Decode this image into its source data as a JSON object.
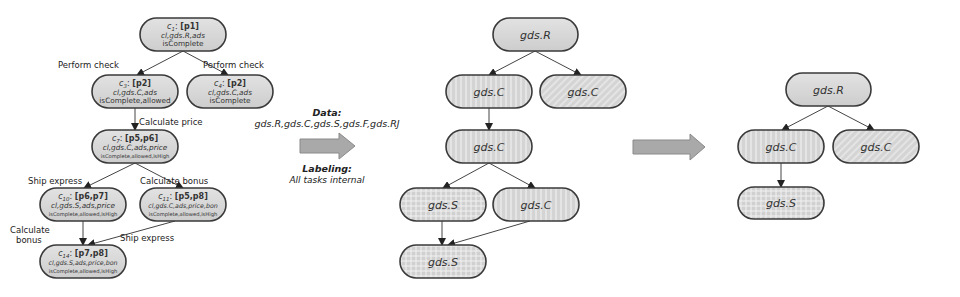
{
  "left_graph": {
    "nodes": [
      {
        "id": "c1",
        "label": "c",
        "sub": "1",
        "places": "[p1]",
        "line2": "cl,gds.R,ads",
        "line3": "isComplete",
        "x": 140,
        "y": 18,
        "w": 86,
        "h": 33
      },
      {
        "id": "c3",
        "label": "c",
        "sub": "3",
        "places": "[p2]",
        "line2": "cl,gds.C,ads",
        "line3": "isComplete,allowed",
        "x": 92,
        "y": 75,
        "w": 86,
        "h": 33
      },
      {
        "id": "c4",
        "label": "c",
        "sub": "4",
        "places": "[p2]",
        "line2": "cl,gds.C,ads",
        "line3": "isComplete",
        "x": 187,
        "y": 75,
        "w": 86,
        "h": 33
      },
      {
        "id": "c7",
        "label": "c",
        "sub": "7",
        "places": "[p5,p6]",
        "line2": "cl,gds.C,ads,price",
        "line3": "isComplete,allowed,isHigh",
        "x": 92,
        "y": 130,
        "w": 86,
        "h": 33
      },
      {
        "id": "c10",
        "label": "c",
        "sub": "10",
        "places": "[p6,p7]",
        "line2": "cl,gds.S,ads,price",
        "line3": "isComplete,allowed,isHigh",
        "x": 40,
        "y": 188,
        "w": 86,
        "h": 33
      },
      {
        "id": "c11",
        "label": "c",
        "sub": "11",
        "places": "[p5,p8]",
        "line2": "cl,gds.C,ads,price,bon",
        "line3": "isComplete,allowed,isHigh",
        "x": 140,
        "y": 188,
        "w": 86,
        "h": 33
      },
      {
        "id": "c14",
        "label": "c",
        "sub": "14",
        "places": "[p7,p8]",
        "line2": "cl,gds.S,ads,price,bon",
        "line3": "isComplete,allowed,isHigh",
        "x": 40,
        "y": 245,
        "w": 86,
        "h": 33
      }
    ],
    "edge_labels": [
      {
        "text": "Perform check",
        "x": 58,
        "y": 68
      },
      {
        "text": "Perform check",
        "x": 203,
        "y": 68
      },
      {
        "text": "Calculate price",
        "x": 139,
        "y": 125
      },
      {
        "text": "Ship express",
        "x": 28,
        "y": 184
      },
      {
        "text": "Calculate bonus",
        "x": 140,
        "y": 184
      },
      {
        "text": "Calculate",
        "x": 10,
        "y": 233
      },
      {
        "text": "bonus",
        "x": 16,
        "y": 243
      },
      {
        "text": "Ship express",
        "x": 120,
        "y": 241
      }
    ]
  },
  "transform": {
    "data_title": "Data:",
    "data_value": "gds.R,gds.C,gds.S,gds.F,gds.RJ",
    "labeling_title": "Labeling:",
    "labeling_value": "All tasks internal"
  },
  "middle_graph": {
    "nodes": [
      {
        "id": "m1",
        "label": "gds.R",
        "fill": "plain",
        "x": 493,
        "y": 18,
        "w": 85,
        "h": 33
      },
      {
        "id": "m2",
        "label": "gds.C",
        "fill": "vstripe",
        "x": 446,
        "y": 75,
        "w": 86,
        "h": 33
      },
      {
        "id": "m3",
        "label": "gds.C",
        "fill": "diag",
        "x": 540,
        "y": 75,
        "w": 86,
        "h": 33
      },
      {
        "id": "m4",
        "label": "gds.C",
        "fill": "vstripe",
        "x": 446,
        "y": 130,
        "w": 86,
        "h": 33
      },
      {
        "id": "m5",
        "label": "gds.S",
        "fill": "grid",
        "x": 400,
        "y": 188,
        "w": 86,
        "h": 33
      },
      {
        "id": "m6",
        "label": "gds.C",
        "fill": "vstripe",
        "x": 493,
        "y": 188,
        "w": 86,
        "h": 33
      },
      {
        "id": "m7",
        "label": "gds.S",
        "fill": "grid",
        "x": 400,
        "y": 245,
        "w": 86,
        "h": 33
      }
    ]
  },
  "right_graph": {
    "nodes": [
      {
        "id": "r1",
        "label": "gds.R",
        "fill": "plain",
        "x": 786,
        "y": 73,
        "w": 85,
        "h": 33
      },
      {
        "id": "r2",
        "label": "gds.C",
        "fill": "vstripe",
        "x": 738,
        "y": 130,
        "w": 86,
        "h": 33
      },
      {
        "id": "r3",
        "label": "gds.C",
        "fill": "diag",
        "x": 833,
        "y": 130,
        "w": 86,
        "h": 33
      },
      {
        "id": "r4",
        "label": "gds.S",
        "fill": "grid",
        "x": 738,
        "y": 187,
        "w": 86,
        "h": 32
      }
    ]
  },
  "colors": {
    "node_fill": "#d6d6d6",
    "node_stroke": "#3a3a3a",
    "edge": "#444444",
    "arrow_fill": "#a8a8a8",
    "arrow_stroke": "#8a8a8a",
    "text": "#333333"
  }
}
